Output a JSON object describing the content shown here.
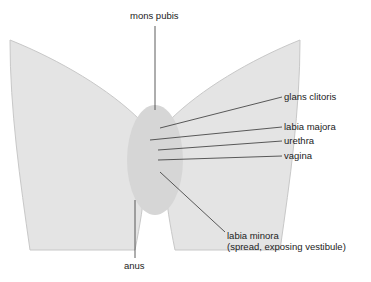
{
  "diagram": {
    "labels": {
      "mons_pubis": "mons pubis",
      "glans_clitoris": "glans clitoris",
      "labia_majora": "labia majora",
      "urethra": "urethra",
      "vagina": "vagina",
      "labia_minora_line1": "labia minora",
      "labia_minora_line2": "(spread, exposing vestibule)",
      "anus": "anus"
    },
    "colors": {
      "shape_fill": "#e4e4e4",
      "shape_shade": "#c8c8c8",
      "leader_line": "#333333"
    }
  }
}
